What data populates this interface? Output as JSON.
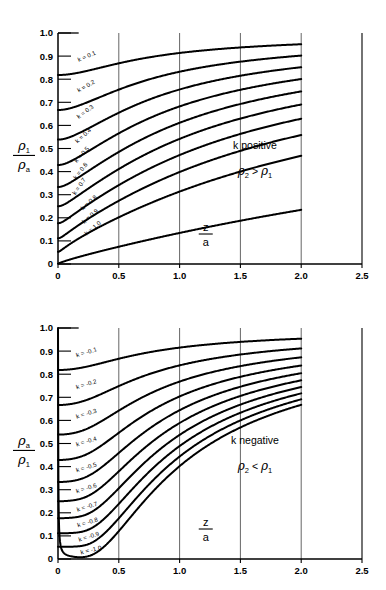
{
  "figure": {
    "background": "#ffffff",
    "ink": "#000000",
    "gridline_color": "#555555"
  },
  "chart_data": [
    {
      "type": "line",
      "panel": "top",
      "title": "",
      "xlabel": "z/a",
      "ylabel": "rho_1 / rho_a",
      "ylabel_numerator": "ρ",
      "ylabel_numerator_sub": "1",
      "ylabel_denominator": "ρ",
      "ylabel_denominator_sub": "a",
      "xlabel_numerator": "z",
      "xlabel_denominator": "a",
      "xlim": [
        0,
        2.5
      ],
      "ylim": [
        0,
        1.0
      ],
      "xticks": [
        0,
        0.5,
        1.0,
        1.5,
        2.0,
        2.5
      ],
      "xticklabels": [
        "0",
        "0.5",
        "1.0",
        "1.5",
        "2.0",
        "2.5"
      ],
      "yticks": [
        0,
        0.1,
        0.2,
        0.3,
        0.4,
        0.5,
        0.6,
        0.7,
        0.8,
        0.9,
        1.0
      ],
      "yticklabels": [
        "0",
        "0.1",
        "0.2",
        "0.3",
        "0.4",
        "0.5",
        "0.6",
        "0.7",
        "0.8",
        "0.9",
        "1.0"
      ],
      "grid": true,
      "gridlines_x": [
        0.5,
        1.0,
        1.5,
        2.0
      ],
      "curve_x_extent": [
        0,
        2.0
      ],
      "annotations": [
        {
          "name": "k-sign-note",
          "text": "k  positive"
        },
        {
          "name": "rho-inequality-note",
          "text": "ρ₂ > ρ₁"
        }
      ],
      "series": [
        {
          "name": "k = 0.1",
          "k": 0.1,
          "label": "k = 0.1",
          "label_x": 0.17,
          "label_y": 0.875,
          "label_rotation": -23
        },
        {
          "name": "k = 0.2",
          "k": 0.2,
          "label": "k = 0.2",
          "label_x": 0.17,
          "label_y": 0.742,
          "label_rotation": -30
        },
        {
          "name": "k = 0.3",
          "k": 0.3,
          "label": "k = 0.3",
          "label_x": 0.17,
          "label_y": 0.628,
          "label_rotation": -36
        },
        {
          "name": "k = 0.4",
          "k": 0.4,
          "label": "k = 0.4",
          "label_x": 0.16,
          "label_y": 0.522,
          "label_rotation": -42
        },
        {
          "name": "k = 0.5",
          "k": 0.5,
          "label": "k = 0.5",
          "label_x": 0.155,
          "label_y": 0.437,
          "label_rotation": -48
        },
        {
          "name": "k = 0.6",
          "k": 0.6,
          "label": "k = 0.6",
          "label_x": 0.15,
          "label_y": 0.365,
          "label_rotation": -52
        },
        {
          "name": "k = 0.7",
          "k": 0.7,
          "label": "k = 0.7",
          "label_x": 0.145,
          "label_y": 0.297,
          "label_rotation": -56
        },
        {
          "name": "k = 0.8",
          "k": 0.8,
          "label": "k = 0.8",
          "label_x": 0.205,
          "label_y": 0.232,
          "label_rotation": -41
        },
        {
          "name": "k = 0.9",
          "k": 0.9,
          "label": "k = 0.9",
          "label_x": 0.215,
          "label_y": 0.173,
          "label_rotation": -41
        },
        {
          "name": "k = 1.0",
          "k": 1.0,
          "label": "k = 1.0",
          "label_x": 0.235,
          "label_y": 0.122,
          "label_rotation": -39
        }
      ],
      "y_intercepts": [
        0.82,
        0.66,
        0.53,
        0.42,
        0.325,
        0.25,
        0.18,
        0.12,
        0.06,
        0.0
      ],
      "values_at_x2": [
        0.995,
        0.99,
        0.985,
        0.978,
        0.972,
        0.965,
        0.957,
        0.95,
        0.942,
        0.935
      ]
    },
    {
      "type": "line",
      "panel": "bottom",
      "title": "",
      "xlabel": "z/a",
      "ylabel": "rho_a / rho_1",
      "ylabel_numerator": "ρ",
      "ylabel_numerator_sub": "a",
      "ylabel_denominator": "ρ",
      "ylabel_denominator_sub": "1",
      "xlabel_numerator": "z",
      "xlabel_denominator": "a",
      "xlim": [
        0,
        2.5
      ],
      "ylim": [
        0,
        1.0
      ],
      "xticks": [
        0,
        0.5,
        1.0,
        1.5,
        2.0,
        2.5
      ],
      "xticklabels": [
        "0",
        "0.5",
        "1.0",
        "1.5",
        "2.0",
        "2.5"
      ],
      "yticks": [
        0,
        0.1,
        0.2,
        0.3,
        0.4,
        0.5,
        0.6,
        0.7,
        0.8,
        0.9,
        1.0
      ],
      "yticklabels": [
        "0",
        "0.1",
        "0.2",
        "0.3",
        "0.4",
        "0.5",
        "0.6",
        "0.7",
        "0.8",
        "0.9",
        "1.0"
      ],
      "grid": true,
      "gridlines_x": [
        0.5,
        1.0,
        1.5,
        2.0
      ],
      "curve_x_extent": [
        0,
        2.0
      ],
      "annotations": [
        {
          "name": "k-sign-note",
          "text": "k  negative"
        },
        {
          "name": "rho-inequality-note",
          "text": "ρ₂ < ρ₁"
        }
      ],
      "series": [
        {
          "name": "k = -0.1",
          "k": -0.1,
          "label": "k = -0.1",
          "label_x": 0.155,
          "label_y": 0.873,
          "label_rotation": -17
        },
        {
          "name": "k = -0.2",
          "k": -0.2,
          "label": "k = -0.2",
          "label_x": 0.155,
          "label_y": 0.735,
          "label_rotation": -17
        },
        {
          "name": "k = -0.3",
          "k": -0.3,
          "label": "k = -0.3",
          "label_x": 0.155,
          "label_y": 0.607,
          "label_rotation": -17
        },
        {
          "name": "k = -0.4",
          "k": -0.4,
          "label": "k = -0.4",
          "label_x": 0.155,
          "label_y": 0.487,
          "label_rotation": -17
        },
        {
          "name": "k = -0.5",
          "k": -0.5,
          "label": "k = -0.5",
          "label_x": 0.155,
          "label_y": 0.375,
          "label_rotation": -17
        },
        {
          "name": "k = -0.6",
          "k": -0.6,
          "label": "k = -0.6",
          "label_x": 0.155,
          "label_y": 0.285,
          "label_rotation": -17
        },
        {
          "name": "k = -0.7",
          "k": -0.7,
          "label": "k = -0.7",
          "label_x": 0.16,
          "label_y": 0.205,
          "label_rotation": -17
        },
        {
          "name": "k = -0.8",
          "k": -0.8,
          "label": "k = -0.8",
          "label_x": 0.165,
          "label_y": 0.137,
          "label_rotation": -17
        },
        {
          "name": "k = -0.9",
          "k": -0.9,
          "label": "k = -0.9",
          "label_x": 0.175,
          "label_y": 0.075,
          "label_rotation": -17
        },
        {
          "name": "k = -1.0",
          "k": -1.0,
          "label": "k = -1.0",
          "label_x": 0.19,
          "label_y": 0.02,
          "label_rotation": -13
        }
      ],
      "y_intercepts": [
        0.82,
        0.665,
        0.535,
        0.43,
        0.33,
        0.255,
        0.18,
        0.115,
        0.055,
        0.03
      ],
      "values_at_x2": [
        0.995,
        0.99,
        0.985,
        0.978,
        0.97,
        0.963,
        0.955,
        0.948,
        0.94,
        0.932
      ]
    }
  ]
}
